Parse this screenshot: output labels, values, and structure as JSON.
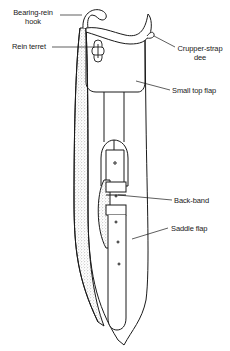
{
  "diagram": {
    "labels": [
      {
        "id": "bearing-rein-hook",
        "line1": "Bearing-rein",
        "line2": "hook"
      },
      {
        "id": "rein-terret",
        "line1": "Rein terret"
      },
      {
        "id": "crupper-strap-dee",
        "line1": "Crupper-strap",
        "line2": "dee"
      },
      {
        "id": "small-top-flap",
        "line1": "Small top flap"
      },
      {
        "id": "back-band",
        "line1": "Back-band"
      },
      {
        "id": "saddle-flap",
        "line1": "Saddle flap"
      }
    ],
    "colors": {
      "ink": "#1a1a1a",
      "background": "#ffffff",
      "stipple": "#9a9a9a"
    }
  }
}
